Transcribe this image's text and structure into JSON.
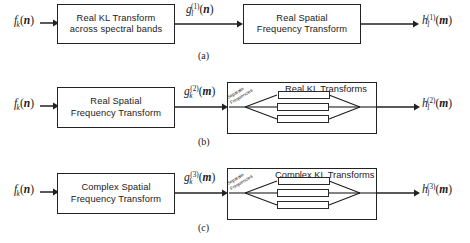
{
  "figure": {
    "background": "#ffffff",
    "line_color": "#222222"
  },
  "rows": [
    {
      "id": "a",
      "caption": "(a)",
      "input_label": {
        "base": "f",
        "sub": "k",
        "sup": "",
        "arg": "n"
      },
      "mid_label": {
        "base": "g",
        "sub": "l",
        "sup": "(1)",
        "arg": "n"
      },
      "output_label": {
        "base": "h",
        "sub": "l",
        "sup": "(1)",
        "arg": "m"
      },
      "box1": [
        "Real KL Transform",
        "across spectral bands"
      ],
      "box2": [
        "Real Spatial",
        "Frequency Transform"
      ],
      "has_bank": false
    },
    {
      "id": "b",
      "caption": "(b)",
      "input_label": {
        "base": "f",
        "sub": "k",
        "sup": "",
        "arg": "n"
      },
      "mid_label": {
        "base": "g",
        "sub": "k",
        "sup": "(2)",
        "arg": "m"
      },
      "output_label": {
        "base": "h",
        "sub": "l",
        "sup": "(2)",
        "arg": "m"
      },
      "box1": [
        "Real Spatial",
        "Frequency Transform"
      ],
      "bank_title": "Real KL Transforms",
      "bank_note": [
        "Separate",
        "Frequencies"
      ],
      "bank_branches": 3,
      "has_bank": true
    },
    {
      "id": "c",
      "caption": "(c)",
      "input_label": {
        "base": "f",
        "sub": "k",
        "sup": "",
        "arg": "n"
      },
      "mid_label": {
        "base": "g",
        "sub": "k",
        "sup": "(3)",
        "arg": "m"
      },
      "output_label": {
        "base": "h",
        "sub": "l",
        "sup": "(3)",
        "arg": "m"
      },
      "box1": [
        "Complex Spatial",
        "Frequency Transform"
      ],
      "bank_title": "Complex KL Transforms",
      "bank_note": [
        "Separate",
        "Frequencies"
      ],
      "bank_branches": 3,
      "has_bank": true
    }
  ]
}
